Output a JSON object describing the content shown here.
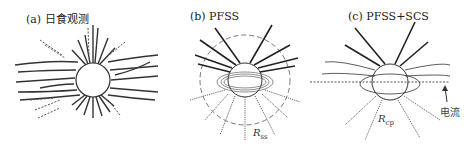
{
  "panels": [
    {
      "id": "a",
      "title": "(a) 日食观测"
    },
    {
      "id": "b",
      "title": "(b) PFSS",
      "radius_label": "R",
      "radius_sub": "ss"
    },
    {
      "id": "c",
      "title": "(c) PFSS+SCS",
      "radius_label": "R",
      "radius_sub": "cp",
      "current_label": "电流"
    }
  ],
  "colors": {
    "line": "#333333",
    "dotted": "#666666",
    "background": "#ffffff"
  }
}
